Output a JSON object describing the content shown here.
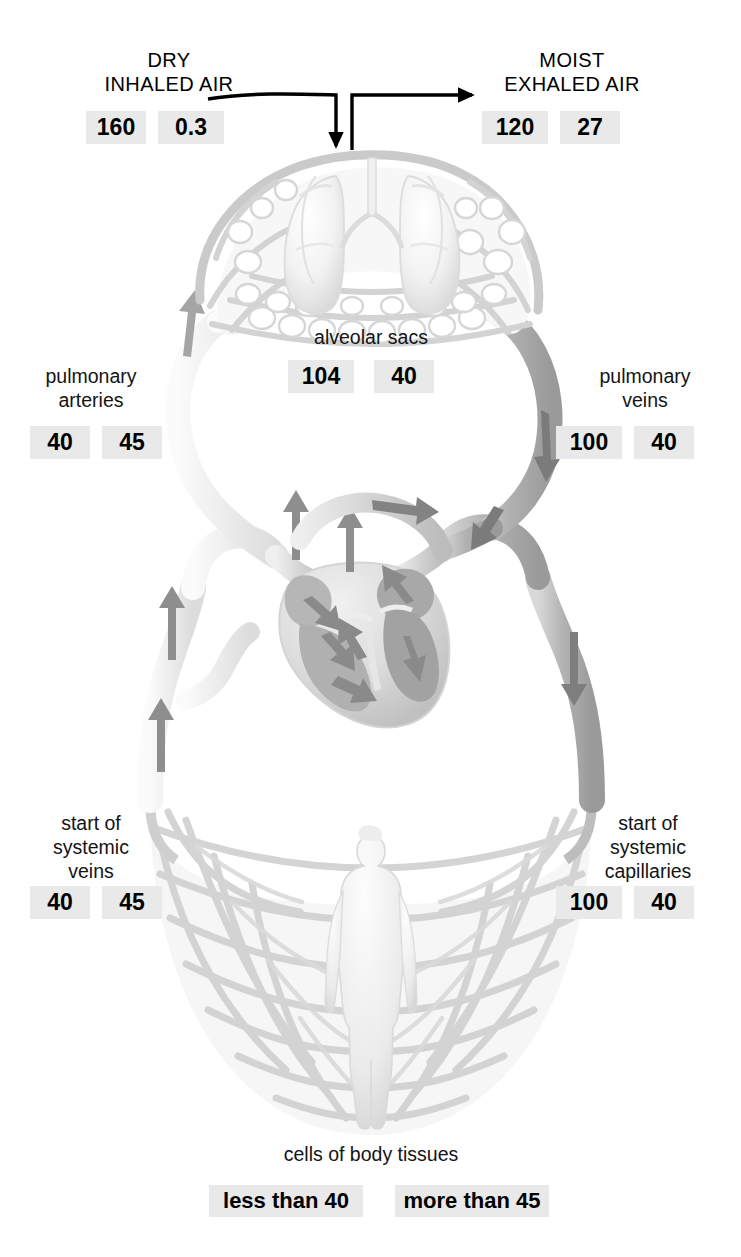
{
  "diagram": {
    "units_note": "values in mmHg",
    "colors": {
      "chip_background": "#e9e9e9",
      "text": "#111111",
      "arrow_line": "#000000",
      "vessel_light": "#f1f1f1",
      "vessel_mid": "#d8d8d8",
      "vessel_dark": "#a9a9a9",
      "flow_arrow": "#8b8b8b",
      "heart_chamber": "#b4b4b4",
      "capillary_mesh": "#d9d9d9"
    }
  },
  "labels": {
    "dry_inhaled_air": "DRY\nINHALED AIR",
    "moist_exhaled_air": "MOIST\nEXHALED AIR",
    "alveolar_sacs": "alveolar sacs",
    "pulmonary_arteries": "pulmonary\narteries",
    "pulmonary_veins": "pulmonary\nveins",
    "start_of_systemic_veins": "start of\nsystemic\nveins",
    "start_of_systemic_capillaries": "start of\nsystemic\ncapillaries",
    "cells_of_body_tissues": "cells of body tissues"
  },
  "values": {
    "dry_inhaled_air": {
      "o2": "160",
      "co2": "0.3"
    },
    "moist_exhaled_air": {
      "o2": "120",
      "co2": "27"
    },
    "alveolar_sacs": {
      "o2": "104",
      "co2": "40"
    },
    "pulmonary_arteries": {
      "o2": "40",
      "co2": "45"
    },
    "pulmonary_veins": {
      "o2": "100",
      "co2": "40"
    },
    "systemic_veins": {
      "o2": "40",
      "co2": "45"
    },
    "systemic_capillaries": {
      "o2": "100",
      "co2": "40"
    },
    "body_tissue_cells": {
      "o2": "less than 40",
      "co2": "more than 45"
    }
  },
  "flow_arrows": {
    "inhale_arrow": "inhaled-air-into-lungs",
    "exhale_arrow": "exhaled-air-out-of-lungs"
  }
}
